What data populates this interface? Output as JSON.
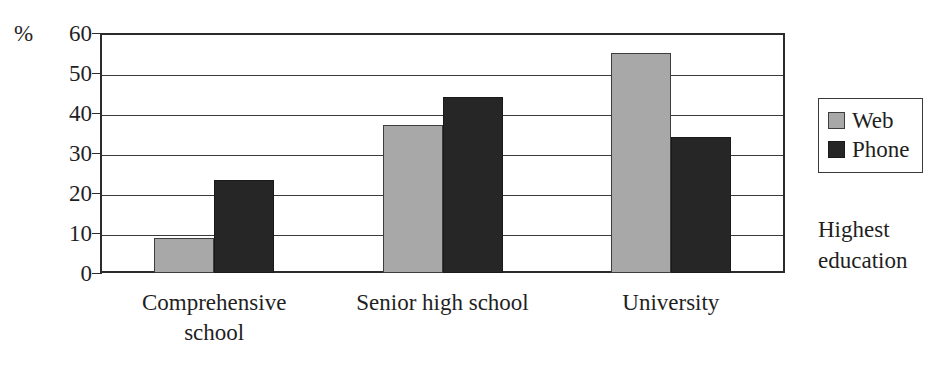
{
  "chart_data": {
    "type": "bar",
    "title": "",
    "xlabel": "Highest education",
    "ylabel": "%",
    "categories": [
      "Comprehensive school",
      "Senior high school",
      "University"
    ],
    "category_lines": [
      [
        "Comprehensive",
        "school"
      ],
      [
        "Senior high school"
      ],
      [
        "University"
      ]
    ],
    "series": [
      {
        "name": "Web",
        "color": "#a8a8a8",
        "values": [
          8.7,
          37,
          55
        ]
      },
      {
        "name": "Phone",
        "color": "#262626",
        "values": [
          23.3,
          44,
          34
        ]
      }
    ],
    "ylim": [
      0,
      60
    ],
    "ytick_step": 10,
    "yticks": [
      60,
      50,
      40,
      30,
      20,
      10,
      0
    ],
    "ytick_labels": [
      "60",
      "50",
      "40",
      "30",
      "20",
      "10",
      "0"
    ],
    "grid": true,
    "grid_axis": "y",
    "legend_position": "right",
    "legend_entries": [
      "Web",
      "Phone"
    ],
    "axis_title_lines": [
      "Highest",
      "education"
    ]
  },
  "axis": {
    "percent_symbol": "%"
  }
}
